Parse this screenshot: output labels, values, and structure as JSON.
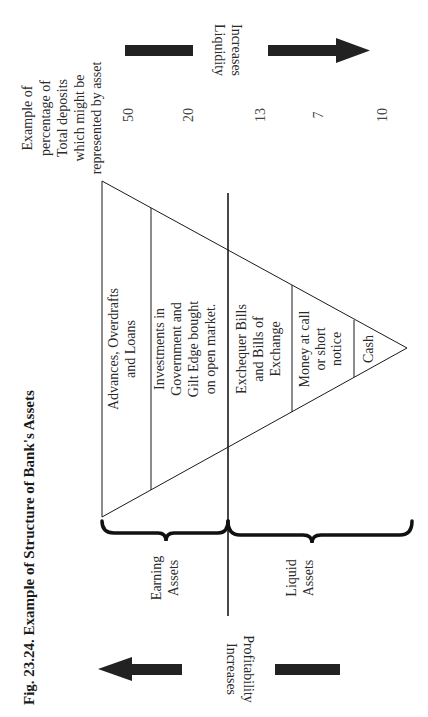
{
  "figure": {
    "title": "Fig. 23.24. Example of Structure of Bank's Assets"
  },
  "header": {
    "lines": [
      "Example of",
      "percentage of",
      "Total deposits",
      "which might be",
      "represented by asset"
    ]
  },
  "liquidity_arrow": {
    "lines": [
      "Liquidity",
      "Increases"
    ]
  },
  "profitability_arrow": {
    "lines": [
      "Profitability",
      "Increases"
    ]
  },
  "segments": [
    {
      "lines": [
        "Advances, Overdrafts",
        "and Loans"
      ],
      "percent": "50"
    },
    {
      "lines": [
        "Investments in",
        "Government and",
        "Gilt Edge bought",
        "on open market."
      ],
      "percent": "20"
    },
    {
      "lines": [
        "Exchequer Bills",
        "and Bills of",
        "Exchange"
      ],
      "percent": "13"
    },
    {
      "lines": [
        "Money at call",
        "or short",
        "notice"
      ],
      "percent": "7"
    },
    {
      "lines": [
        "Cash"
      ],
      "percent": "10"
    }
  ],
  "groups": [
    {
      "lines": [
        "Earning",
        "Assets"
      ]
    },
    {
      "lines": [
        "Liquid",
        "Assets"
      ]
    }
  ],
  "colors": {
    "ink": "#1a1a1a",
    "arrow": "#222222",
    "background": "#ffffff"
  }
}
